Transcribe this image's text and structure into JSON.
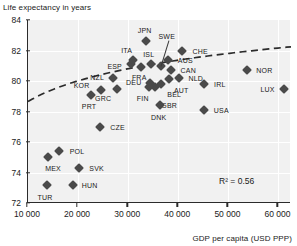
{
  "chart_data": {
    "type": "scatter",
    "title": "",
    "ylabel": "Life expectancy in years",
    "xlabel": "GDP per capita (USD PPP)",
    "xlim": [
      10000,
      62500
    ],
    "ylim": [
      72,
      84
    ],
    "xticks": [
      10000,
      20000,
      30000,
      40000,
      50000,
      60000
    ],
    "xtick_labels": [
      "10 000",
      "20 000",
      "30 000",
      "40 000",
      "50 000",
      "60 000"
    ],
    "yticks": [
      72,
      74,
      76,
      78,
      80,
      82,
      84
    ],
    "ytick_labels": [
      "72",
      "74",
      "76",
      "78",
      "80",
      "82",
      "84"
    ],
    "grid": true,
    "legend": "none",
    "annotation": "R² = 0.56",
    "trendline": "logarithmic fit, dashed",
    "marker_color": "#4a4a4a",
    "plot_background": "#f1f1f1",
    "axis_color": "#2b2b2b",
    "points": [
      {
        "code": "TUR",
        "x": 13800,
        "y": 73.2,
        "lx": -2,
        "ly": 12
      },
      {
        "code": "MEX",
        "x": 14000,
        "y": 75.0,
        "lx": 5,
        "ly": 11
      },
      {
        "code": "POL",
        "x": 16200,
        "y": 75.4,
        "lx": 18,
        "ly": 0
      },
      {
        "code": "HUN",
        "x": 18900,
        "y": 73.2,
        "lx": 17,
        "ly": 0
      },
      {
        "code": "SVK",
        "x": 20100,
        "y": 74.3,
        "lx": 18,
        "ly": 0
      },
      {
        "code": "CZE",
        "x": 24300,
        "y": 77.0,
        "lx": 18,
        "ly": 0
      },
      {
        "code": "PRT",
        "x": 22600,
        "y": 79.1,
        "lx": -2,
        "ly": 11
      },
      {
        "code": "KOR",
        "x": 24500,
        "y": 79.4,
        "lx": -19,
        "ly": -5
      },
      {
        "code": "GRC",
        "x": 27800,
        "y": 79.5,
        "lx": -14,
        "ly": 9
      },
      {
        "code": "NZL",
        "x": 27000,
        "y": 80.2,
        "lx": -16,
        "ly": -1
      },
      {
        "code": "ESP",
        "x": 30500,
        "y": 81.1,
        "lx": -16,
        "ly": 2
      },
      {
        "code": "ITA",
        "x": 30900,
        "y": 81.4,
        "lx": -6,
        "ly": -10
      },
      {
        "code": "FRA",
        "x": 32600,
        "y": 80.9,
        "lx": -2,
        "ly": 10
      },
      {
        "code": "ISL",
        "x": 34500,
        "y": 81.1,
        "lx": -2,
        "ly": -10
      },
      {
        "code": "JPN",
        "x": 33500,
        "y": 82.6,
        "lx": -1,
        "ly": -11
      },
      {
        "code": "SWE",
        "x": 36500,
        "y": 81.0,
        "lx": 6,
        "ly": -30
      },
      {
        "code": "AUS",
        "x": 38000,
        "y": 81.4,
        "lx": 17,
        "ly": 0
      },
      {
        "code": "CAN",
        "x": 38600,
        "y": 80.7,
        "lx": 17,
        "ly": 0
      },
      {
        "code": "CHE",
        "x": 40800,
        "y": 82.0,
        "lx": 18,
        "ly": 0
      },
      {
        "code": "NLD",
        "x": 40100,
        "y": 80.2,
        "lx": 17,
        "ly": 0
      },
      {
        "code": "DEU",
        "x": 34300,
        "y": 79.9,
        "lx": -16,
        "ly": -1
      },
      {
        "code": "BEL",
        "x": 36600,
        "y": 79.8,
        "lx": 13,
        "ly": 10
      },
      {
        "code": "GBR",
        "x": 35400,
        "y": 79.6,
        "lx": 14,
        "ly": 18
      },
      {
        "code": "AUT",
        "x": 38200,
        "y": 80.1,
        "lx": 12,
        "ly": 11
      },
      {
        "code": "FIN",
        "x": 34100,
        "y": 79.6,
        "lx": -6,
        "ly": 11
      },
      {
        "code": "DNK",
        "x": 36300,
        "y": 78.4,
        "lx": -1,
        "ly": 12
      },
      {
        "code": "IRL",
        "x": 45100,
        "y": 79.8,
        "lx": 16,
        "ly": 0
      },
      {
        "code": "USA",
        "x": 45200,
        "y": 78.1,
        "lx": 17,
        "ly": 0
      },
      {
        "code": "NOR",
        "x": 53800,
        "y": 80.7,
        "lx": 17,
        "ly": 0
      },
      {
        "code": "LUX",
        "x": 61200,
        "y": 79.5,
        "lx": -17,
        "ly": 0
      }
    ],
    "leaders": [
      {
        "code": "SWE",
        "from_x": 36500,
        "from_y": 81.0,
        "to_lx": 8,
        "to_ly": -26
      }
    ]
  }
}
